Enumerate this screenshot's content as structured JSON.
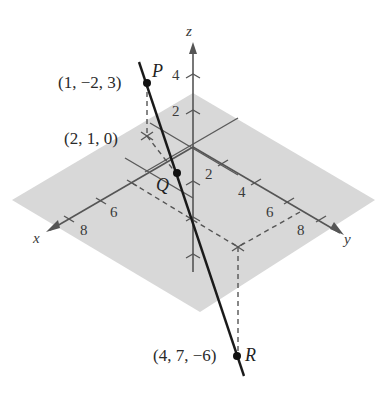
{
  "figure": {
    "type": "3d-line-through-points",
    "colors": {
      "plane": "#d6d6d6",
      "axis": "#555555",
      "line": "#1a1a1a",
      "dashed": "#555555",
      "text": "#2a2a2a"
    },
    "axes": {
      "x": {
        "label": "x",
        "ticks": [
          "6",
          "8"
        ]
      },
      "y": {
        "label": "y",
        "ticks": [
          "2",
          "4",
          "6",
          "8"
        ]
      },
      "z": {
        "label": "z",
        "ticks": [
          "2",
          "4"
        ]
      }
    },
    "points": {
      "P": {
        "name": "P",
        "coords": "(1, −2, 3)"
      },
      "Q": {
        "name": "Q",
        "coords": ""
      },
      "R": {
        "name": "R",
        "coords": "(4, 7, −6)"
      },
      "S": {
        "coords": "(2, 1, 0)"
      }
    }
  }
}
